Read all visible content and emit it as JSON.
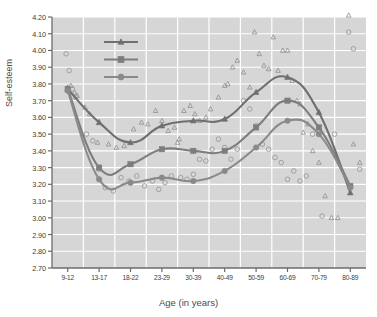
{
  "chart_data": {
    "type": "line",
    "title": "",
    "xlabel": "Age (in years)",
    "ylabel": "Self-esteem",
    "categories": [
      "9-12",
      "13-17",
      "18-22",
      "23-29",
      "30-39",
      "40-49",
      "50-59",
      "60-69",
      "70-79",
      "80-89"
    ],
    "ylim": [
      2.7,
      4.2
    ],
    "ytick_labels": [
      "2.70",
      "2.80",
      "2.90",
      "3.00",
      "3.10",
      "3.20",
      "3.30",
      "3.40",
      "3.50",
      "3.60",
      "3.70",
      "3.80",
      "3.90",
      "4.00",
      "4.10",
      "4.20"
    ],
    "ytick_values": [
      2.7,
      2.8,
      2.9,
      3.0,
      3.1,
      3.2,
      3.3,
      3.4,
      3.5,
      3.6,
      3.7,
      3.8,
      3.9,
      4.0,
      4.1,
      4.2
    ],
    "ytick_step": 0.1,
    "grid": true,
    "legend_position": "upper-left-inside",
    "series": [
      {
        "name": "Males",
        "marker": "triangle",
        "color": "#6f6f6f",
        "values": [
          3.77,
          3.57,
          3.45,
          3.55,
          3.58,
          3.59,
          3.75,
          3.84,
          3.63,
          3.15
        ]
      },
      {
        "name": "Total",
        "marker": "square",
        "color": "#7d7d7d",
        "values": [
          3.77,
          3.3,
          3.32,
          3.41,
          3.4,
          3.4,
          3.54,
          3.7,
          3.54,
          3.19
        ]
      },
      {
        "name": "Females",
        "marker": "circle",
        "color": "#8a8a8a",
        "values": [
          3.76,
          3.23,
          3.21,
          3.24,
          3.22,
          3.28,
          3.42,
          3.58,
          3.5,
          3.18
        ]
      }
    ],
    "scatter": {
      "males": {
        "marker": "open-triangle",
        "points": [
          [
            0.0,
            3.78
          ],
          [
            0.1,
            3.79
          ],
          [
            0.22,
            3.75
          ],
          [
            0.3,
            3.73
          ],
          [
            0.55,
            3.66
          ],
          [
            0.7,
            3.62
          ],
          [
            0.95,
            3.45
          ],
          [
            1.3,
            3.44
          ],
          [
            1.55,
            3.42
          ],
          [
            1.8,
            3.43
          ],
          [
            2.1,
            3.53
          ],
          [
            2.35,
            3.57
          ],
          [
            2.55,
            3.56
          ],
          [
            2.8,
            3.64
          ],
          [
            3.0,
            3.58
          ],
          [
            3.2,
            3.52
          ],
          [
            3.4,
            3.54
          ],
          [
            3.55,
            3.47
          ],
          [
            3.5,
            3.45
          ],
          [
            3.7,
            3.64
          ],
          [
            3.9,
            3.67
          ],
          [
            4.05,
            3.62
          ],
          [
            4.2,
            3.58
          ],
          [
            4.4,
            3.6
          ],
          [
            4.55,
            3.65
          ],
          [
            4.8,
            3.72
          ],
          [
            5.0,
            3.79
          ],
          [
            5.1,
            3.8
          ],
          [
            5.25,
            3.9
          ],
          [
            5.4,
            3.94
          ],
          [
            5.6,
            3.87
          ],
          [
            5.8,
            3.78
          ],
          [
            5.95,
            4.11
          ],
          [
            6.1,
            3.98
          ],
          [
            6.25,
            3.91
          ],
          [
            6.4,
            3.89
          ],
          [
            6.55,
            4.08
          ],
          [
            6.7,
            3.88
          ],
          [
            6.85,
            4.0
          ],
          [
            7.0,
            4.0
          ],
          [
            7.15,
            3.82
          ],
          [
            7.3,
            3.7
          ],
          [
            7.4,
            3.68
          ],
          [
            7.5,
            3.51
          ],
          [
            7.65,
            3.56
          ],
          [
            7.8,
            3.4
          ],
          [
            8.0,
            3.33
          ],
          [
            8.2,
            3.13
          ],
          [
            8.4,
            3.0
          ],
          [
            8.6,
            3.0
          ],
          [
            8.95,
            4.21
          ],
          [
            9.1,
            3.44
          ],
          [
            9.3,
            3.33
          ]
        ]
      },
      "females": {
        "marker": "open-circle",
        "points": [
          [
            -0.05,
            3.98
          ],
          [
            0.05,
            3.88
          ],
          [
            0.15,
            3.77
          ],
          [
            0.25,
            3.72
          ],
          [
            0.6,
            3.5
          ],
          [
            0.8,
            3.46
          ],
          [
            1.0,
            3.29
          ],
          [
            1.2,
            3.18
          ],
          [
            1.45,
            3.16
          ],
          [
            1.7,
            3.24
          ],
          [
            1.95,
            3.22
          ],
          [
            2.2,
            3.25
          ],
          [
            2.45,
            3.19
          ],
          [
            2.7,
            3.22
          ],
          [
            2.9,
            3.17
          ],
          [
            3.1,
            3.21
          ],
          [
            3.3,
            3.25
          ],
          [
            3.6,
            3.24
          ],
          [
            3.8,
            3.23
          ],
          [
            4.0,
            3.26
          ],
          [
            4.2,
            3.35
          ],
          [
            4.4,
            3.34
          ],
          [
            4.6,
            3.41
          ],
          [
            4.8,
            3.47
          ],
          [
            5.0,
            3.42
          ],
          [
            5.2,
            3.35
          ],
          [
            5.4,
            3.41
          ],
          [
            5.6,
            3.7
          ],
          [
            5.8,
            3.65
          ],
          [
            6.0,
            3.55
          ],
          [
            6.2,
            3.44
          ],
          [
            6.4,
            3.41
          ],
          [
            6.6,
            3.36
          ],
          [
            6.8,
            3.33
          ],
          [
            7.0,
            3.23
          ],
          [
            7.2,
            3.28
          ],
          [
            7.4,
            3.22
          ],
          [
            7.6,
            3.25
          ],
          [
            7.8,
            3.5
          ],
          [
            8.1,
            3.01
          ],
          [
            8.5,
            3.5
          ],
          [
            8.95,
            4.11
          ],
          [
            9.1,
            4.01
          ],
          [
            9.3,
            3.29
          ]
        ]
      }
    }
  },
  "axes": {
    "y_label": "Self-esteem",
    "x_label": "Age (in years)"
  },
  "legend": {
    "items": [
      {
        "label": "Males",
        "marker": "triangle",
        "color": "#6f6f6f"
      },
      {
        "label": "Total",
        "marker": "square",
        "color": "#7d7d7d"
      },
      {
        "label": "Females",
        "marker": "circle",
        "color": "#8a8a8a"
      }
    ]
  },
  "style": {
    "plot_background": "#d6d6d6",
    "grid_color": "#ffffff",
    "axis_color": "#6b6b6b",
    "text_color": "#3d3d3d"
  }
}
